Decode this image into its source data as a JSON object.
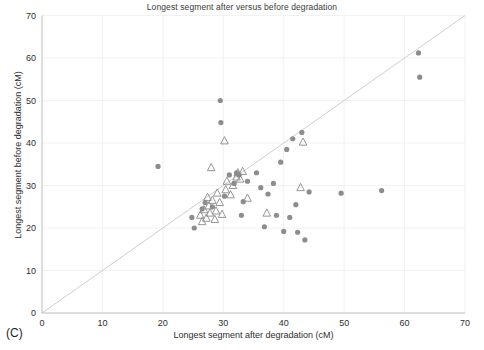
{
  "panel": {
    "label": "(C)"
  },
  "chart_data": {
    "type": "scatter",
    "title": "Longest segment after versus before degradation",
    "xlabel": "Longest segment after degradation (cM)",
    "ylabel": "Longest segment before degradation (cM)",
    "xlim": [
      0,
      70
    ],
    "ylim": [
      0,
      70
    ],
    "xticks": [
      0,
      10,
      20,
      30,
      40,
      50,
      60,
      70
    ],
    "yticks": [
      0,
      10,
      20,
      30,
      40,
      50,
      60,
      70
    ],
    "grid": true,
    "legend": "none",
    "reference_line": {
      "name": "identity-line",
      "from": [
        0,
        0
      ],
      "to": [
        70,
        70
      ],
      "color": "#cfcfcf"
    },
    "marker_colors": {
      "circle_fill": "#8d8d8d",
      "triangle_stroke": "#8a8a8a",
      "axis": "#bdbdbd",
      "grid": "#ededed"
    },
    "series": [
      {
        "name": "circles",
        "marker": "circle",
        "color": "#8d8d8d",
        "points": [
          [
            19.2,
            34.5
          ],
          [
            24.8,
            22.5
          ],
          [
            25.2,
            20.0
          ],
          [
            26.5,
            24.5
          ],
          [
            27.0,
            26.0
          ],
          [
            28.2,
            25.0
          ],
          [
            29.5,
            50.0
          ],
          [
            29.6,
            44.8
          ],
          [
            30.2,
            27.5
          ],
          [
            31.0,
            32.5
          ],
          [
            31.8,
            30.5
          ],
          [
            32.2,
            33.0
          ],
          [
            32.6,
            32.5
          ],
          [
            33.3,
            26.2
          ],
          [
            33.0,
            23.0
          ],
          [
            34.0,
            31.0
          ],
          [
            35.5,
            33.0
          ],
          [
            36.2,
            29.5
          ],
          [
            36.8,
            20.3
          ],
          [
            37.4,
            28.0
          ],
          [
            38.3,
            30.5
          ],
          [
            38.8,
            23.0
          ],
          [
            39.5,
            35.5
          ],
          [
            40.0,
            19.2
          ],
          [
            40.5,
            38.5
          ],
          [
            41.0,
            22.5
          ],
          [
            41.5,
            41.0
          ],
          [
            42.0,
            25.5
          ],
          [
            42.3,
            19.0
          ],
          [
            43.0,
            42.5
          ],
          [
            43.5,
            17.2
          ],
          [
            44.2,
            28.5
          ],
          [
            49.5,
            28.2
          ],
          [
            56.2,
            28.8
          ],
          [
            62.3,
            61.2
          ],
          [
            62.5,
            55.5
          ]
        ]
      },
      {
        "name": "triangles",
        "marker": "triangle",
        "color": "#8a8a8a",
        "points": [
          [
            26.2,
            23.0
          ],
          [
            26.5,
            21.5
          ],
          [
            26.8,
            24.3
          ],
          [
            27.2,
            22.3
          ],
          [
            27.4,
            27.2
          ],
          [
            27.6,
            25.2
          ],
          [
            27.8,
            23.5
          ],
          [
            28.0,
            34.2
          ],
          [
            28.2,
            26.5
          ],
          [
            28.6,
            22.0
          ],
          [
            28.8,
            24.0
          ],
          [
            29.0,
            28.2
          ],
          [
            29.4,
            26.0
          ],
          [
            29.8,
            23.2
          ],
          [
            30.2,
            40.5
          ],
          [
            30.4,
            29.0
          ],
          [
            30.6,
            31.0
          ],
          [
            31.2,
            27.8
          ],
          [
            31.6,
            30.0
          ],
          [
            32.2,
            32.0
          ],
          [
            32.4,
            33.0
          ],
          [
            32.8,
            31.5
          ],
          [
            33.2,
            33.3
          ],
          [
            34.0,
            27.0
          ],
          [
            37.2,
            23.5
          ],
          [
            42.8,
            29.5
          ],
          [
            43.2,
            40.2
          ]
        ]
      }
    ]
  }
}
